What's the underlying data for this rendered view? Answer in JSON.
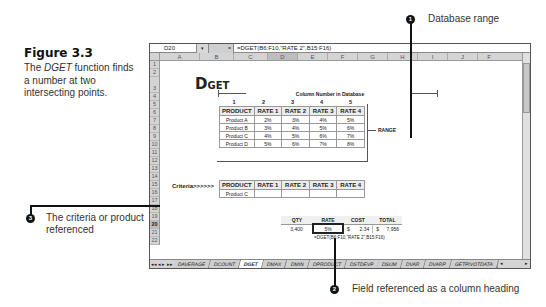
{
  "figure": {
    "title": "Figure 3.3",
    "text_pre": "The ",
    "text_italic": "DGET",
    "text_post": " function finds a number at two intersecting points."
  },
  "formula_bar": {
    "name_box": "D20",
    "dropdown": "▾",
    "fx": "=",
    "formula": "=DGET(B6:F10,\"RATE 2\",B15:F16)"
  },
  "columns": [
    "A",
    "B",
    "C",
    "D",
    "E",
    "F",
    "G",
    "H",
    "I",
    "J",
    "F"
  ],
  "active_column": "D",
  "rows": [
    "1",
    "2",
    "3",
    "4",
    "5",
    "6",
    "7",
    "8",
    "9",
    "10",
    "11",
    "12",
    "13",
    "14",
    "15",
    "16",
    "17",
    "18",
    "19",
    "20",
    "21",
    "22"
  ],
  "active_row": "20",
  "sheet": {
    "title_big": "D",
    "title_small": "GET",
    "column_number_label": "Column Number in Database",
    "column_numbers": [
      "1",
      "2",
      "3",
      "4",
      "5"
    ],
    "database": {
      "headers": [
        "PRODUCT",
        "RATE 1",
        "RATE 2",
        "RATE 3",
        "RATE 4"
      ],
      "rows": [
        [
          "Product A",
          "2%",
          "3%",
          "4%",
          "5%"
        ],
        [
          "Product B",
          "3%",
          "4%",
          "5%",
          "6%"
        ],
        [
          "Product C",
          "4%",
          "5%",
          "6%",
          "7%"
        ],
        [
          "Product D",
          "5%",
          "6%",
          "7%",
          "8%"
        ]
      ]
    },
    "range_label": "RANGE",
    "criteria_label": "Criteria>>>>>>",
    "criteria": {
      "headers": [
        "PRODUCT",
        "RATE 1",
        "RATE 2",
        "RATE 3",
        "RATE 4"
      ],
      "row": [
        "Product C",
        "",
        "",
        "",
        ""
      ]
    },
    "calc": {
      "headers": [
        "QTY",
        "RATE",
        "COST",
        "",
        "TOTAL"
      ],
      "values": [
        "3,400",
        "5%",
        "$",
        "2.34",
        "$",
        "7,956"
      ]
    },
    "formula_note": "=DGET(B6:F10,\"RATE 2\",B15:F16)"
  },
  "tabs": {
    "nav": [
      "◂◂",
      "◂",
      "▸",
      "▸▸"
    ],
    "items": [
      "DAVERAGE",
      "DCOUNT",
      "DGET",
      "DMAX",
      "DMIN",
      "DPRODUCT",
      "DSTDEVP",
      "DSUM",
      "DVAR",
      "DVARP",
      "GETPIVOTDATA"
    ],
    "active": "DGET",
    "hscroll_left": "◂",
    "hscroll_right": "▸"
  },
  "callouts": [
    {
      "num": "1",
      "text": "Database range"
    },
    {
      "num": "2",
      "text": "Field referenced as a column heading"
    },
    {
      "num": "3",
      "text": "The criteria or product referenced"
    }
  ]
}
